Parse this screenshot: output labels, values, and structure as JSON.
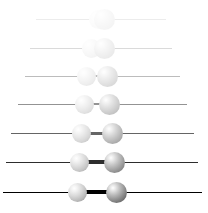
{
  "figure": {
    "width": 208,
    "height": 213,
    "background_color": "#ffffff",
    "axis_color": "#000000",
    "bond_color": "#000000",
    "left_atom_color": "#bdbdbd",
    "right_atom_color": "#6a6a6a"
  },
  "chart_data": {
    "type": "scatter",
    "xlabel": "",
    "ylabel": "",
    "xlim": [
      0,
      208
    ],
    "ylim": [
      0,
      213
    ],
    "grid": false,
    "legend": "none",
    "frame_labels": [
      "frame-1",
      "frame-2",
      "frame-3",
      "frame-4",
      "frame-5",
      "frame-6",
      "frame-7"
    ],
    "frames": [
      {
        "index": 1,
        "y": 19,
        "opacity": 0.07,
        "line_x1": 36,
        "line_x2": 166,
        "line_width": 1,
        "left_atom_x": 98,
        "left_atom_r": 9.5,
        "right_atom_x": 104,
        "right_atom_r": 10.5,
        "separation": 6,
        "bond_x1": 98,
        "bond_x2": 104,
        "bond_thickness": 2
      },
      {
        "index": 2,
        "y": 48,
        "opacity": 0.14,
        "line_x1": 30,
        "line_x2": 172,
        "line_width": 1,
        "left_atom_x": 91,
        "left_atom_r": 9.5,
        "right_atom_x": 104,
        "right_atom_r": 10.5,
        "separation": 13,
        "bond_x1": 91,
        "bond_x2": 104,
        "bond_thickness": 2
      },
      {
        "index": 3,
        "y": 76,
        "opacity": 0.26,
        "line_x1": 25,
        "line_x2": 180,
        "line_width": 1,
        "left_atom_x": 86,
        "left_atom_r": 9.5,
        "right_atom_x": 107,
        "right_atom_r": 10.5,
        "separation": 21,
        "bond_x1": 86,
        "bond_x2": 107,
        "bond_thickness": 2.5
      },
      {
        "index": 4,
        "y": 104,
        "opacity": 0.42,
        "line_x1": 18,
        "line_x2": 187,
        "line_width": 1,
        "left_atom_x": 84,
        "left_atom_r": 9.5,
        "right_atom_x": 109,
        "right_atom_r": 10.5,
        "separation": 25,
        "bond_x1": 84,
        "bond_x2": 109,
        "bond_thickness": 2.5
      },
      {
        "index": 5,
        "y": 133,
        "opacity": 0.6,
        "line_x1": 11,
        "line_x2": 194,
        "line_width": 1,
        "left_atom_x": 81,
        "left_atom_r": 9.5,
        "right_atom_x": 112,
        "right_atom_r": 10.5,
        "separation": 31,
        "bond_x1": 81,
        "bond_x2": 112,
        "bond_thickness": 3
      },
      {
        "index": 6,
        "y": 162,
        "opacity": 0.82,
        "line_x1": 6,
        "line_x2": 198,
        "line_width": 1,
        "left_atom_x": 79,
        "left_atom_r": 9.5,
        "right_atom_x": 114,
        "right_atom_r": 10.5,
        "separation": 35,
        "bond_x1": 79,
        "bond_x2": 114,
        "bond_thickness": 3.5
      },
      {
        "index": 7,
        "y": 192,
        "opacity": 1,
        "line_x1": 3,
        "line_x2": 202,
        "line_width": 1,
        "left_atom_x": 77,
        "left_atom_r": 9.5,
        "right_atom_x": 116,
        "right_atom_r": 10.5,
        "separation": 39,
        "bond_x1": 77,
        "bond_x2": 116,
        "bond_thickness": 3.5
      }
    ]
  }
}
